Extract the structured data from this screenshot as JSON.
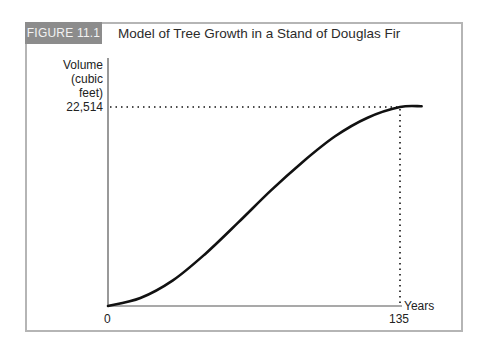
{
  "figure": {
    "tag": "FIGURE 11.1",
    "title": "Model of Tree Growth in a Stand of Douglas Fir"
  },
  "axes": {
    "y_label_lines": [
      "Volume",
      "(cubic",
      "feet)"
    ],
    "y_marked_value": "22,514",
    "x_label": "Years",
    "x_origin": "0",
    "x_marked_value": "135"
  },
  "colors": {
    "tag_background": "#8c8c8c",
    "frame_border": "#b5b5b5",
    "curve": "#111111"
  },
  "chart_data": {
    "type": "line",
    "title": "Model of Tree Growth in a Stand of Douglas Fir",
    "xlabel": "Years",
    "ylabel": "Volume (cubic feet)",
    "x_ticks": [
      "0",
      "135"
    ],
    "y_ticks": [
      "22,514"
    ],
    "xlim": [
      0,
      150
    ],
    "ylim": [
      0,
      25000
    ],
    "grid": false,
    "legend": null,
    "series": [
      {
        "name": "Volume",
        "shape": "sigmoid (S-shaped) growth curve",
        "x": [
          0,
          15,
          30,
          45,
          60,
          75,
          90,
          105,
          120,
          135,
          145
        ],
        "y": [
          0,
          900,
          2900,
          5900,
          9400,
          13000,
          16300,
          19200,
          21300,
          22514,
          22600
        ]
      }
    ],
    "annotations": [
      {
        "type": "dotted-hline",
        "y": 22514,
        "label": "22,514"
      },
      {
        "type": "dotted-vline",
        "x": 135,
        "label": "135"
      }
    ]
  }
}
